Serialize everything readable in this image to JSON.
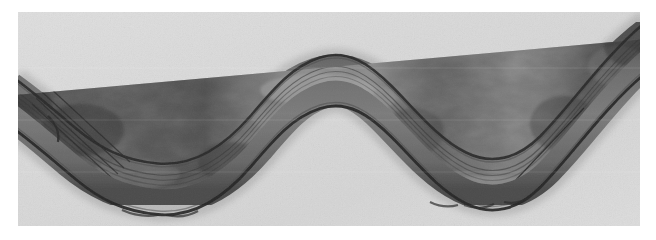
{
  "figure": {
    "kind": "grayscale-micrograph",
    "subject_label": "wavy ribbon-like specimen",
    "page_background": "#ffffff",
    "plate_background": "#d9d9d9",
    "plate": {
      "x": 18,
      "y": 12,
      "width": 622,
      "height": 214
    },
    "canvas": {
      "width": 656,
      "height": 240
    },
    "palette": {
      "background_light": "#dcdcdc",
      "background_mid": "#d2d2d2",
      "membrane_outline_dark": "#2e2e2e",
      "membrane_outline_mid": "#4a4a4a",
      "interior_dark": "#5e5e5e",
      "interior_mid": "#6f6f6f",
      "interior_light": "#8d8d8d",
      "interior_highlight": "#a3a3a3",
      "striation_line": "#3a3a3a"
    },
    "specimen": {
      "form": "sinusoidal band",
      "wave_count": 2.5,
      "band_thickness_px": 52,
      "enters_left_edge": true,
      "exits_right_edge": true,
      "centerline": [
        {
          "x": 0,
          "y": 88
        },
        {
          "x": 24,
          "y": 104
        },
        {
          "x": 52,
          "y": 128
        },
        {
          "x": 80,
          "y": 152
        },
        {
          "x": 110,
          "y": 170
        },
        {
          "x": 140,
          "y": 176
        },
        {
          "x": 172,
          "y": 172
        },
        {
          "x": 204,
          "y": 156
        },
        {
          "x": 232,
          "y": 130
        },
        {
          "x": 258,
          "y": 102
        },
        {
          "x": 286,
          "y": 80
        },
        {
          "x": 316,
          "y": 70
        },
        {
          "x": 346,
          "y": 74
        },
        {
          "x": 376,
          "y": 92
        },
        {
          "x": 404,
          "y": 118
        },
        {
          "x": 430,
          "y": 146
        },
        {
          "x": 456,
          "y": 166
        },
        {
          "x": 484,
          "y": 172
        },
        {
          "x": 512,
          "y": 160
        },
        {
          "x": 540,
          "y": 134
        },
        {
          "x": 566,
          "y": 102
        },
        {
          "x": 594,
          "y": 72
        },
        {
          "x": 622,
          "y": 48
        }
      ],
      "crest_points": [
        {
          "x": 316,
          "y": 70
        }
      ],
      "trough_points": [
        {
          "x": 140,
          "y": 176
        },
        {
          "x": 484,
          "y": 172
        }
      ],
      "striation_zones": [
        {
          "label": "left-inflection-striations",
          "x": 40,
          "y": 120
        },
        {
          "label": "mid-inflection-striations",
          "x": 238,
          "y": 118
        },
        {
          "label": "right-inflection-striations",
          "x": 520,
          "y": 140
        }
      ]
    }
  }
}
